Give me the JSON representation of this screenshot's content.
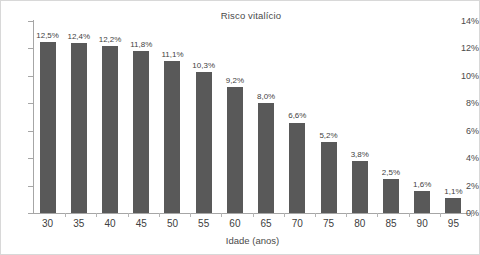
{
  "chart_data": {
    "type": "bar",
    "title": "Risco vitalício",
    "xlabel": "Idade (anos)",
    "ylabel": "",
    "categories": [
      "30",
      "35",
      "40",
      "45",
      "50",
      "55",
      "60",
      "65",
      "70",
      "75",
      "80",
      "85",
      "90",
      "95"
    ],
    "values": [
      12.5,
      12.4,
      12.2,
      11.8,
      11.1,
      10.3,
      9.2,
      8.0,
      6.6,
      5.2,
      3.8,
      2.5,
      1.6,
      1.1
    ],
    "value_labels": [
      "12,5%",
      "12,4%",
      "12,2%",
      "11,8%",
      "11,1%",
      "10,3%",
      "9,2%",
      "8,0%",
      "6,6%",
      "5,2%",
      "3,8%",
      "2,5%",
      "1,6%",
      "1,1%"
    ],
    "ylim": [
      0,
      14
    ],
    "ytick_values": [
      0,
      2,
      4,
      6,
      8,
      10,
      12,
      14
    ],
    "ytick_labels": [
      "0%",
      "2%",
      "4%",
      "6%",
      "8%",
      "10%",
      "12%",
      "14%"
    ],
    "grid": false,
    "legend": false,
    "bar_color": "#595959",
    "axis_color": "#a6a6a6",
    "text_color": "#4a4a4a",
    "background": "#ffffff"
  }
}
